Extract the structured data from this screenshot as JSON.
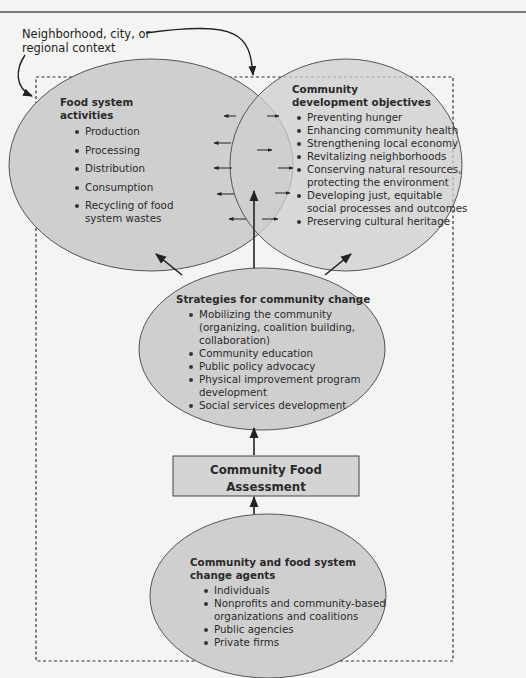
{
  "context_label": {
    "line1": "Neighborhood, city, or",
    "line2": "regional context"
  },
  "food_system": {
    "title": "Food system activities",
    "items": [
      "Production",
      "Processing",
      "Distribution",
      "Consumption",
      "Recycling of food",
      "system wastes"
    ]
  },
  "community_development": {
    "title_line1": "Community",
    "title_line2": "development objectives",
    "items": [
      "Preventing hunger",
      "Enhancing community health",
      "Strengthening local economy",
      "Revitalizing neighborhoods",
      "Conserving natural resources,",
      "protecting the environment",
      "Developing just, equitable",
      "social processes and outcomes",
      "Preserving cultural heritage"
    ]
  },
  "strategies": {
    "title": "Strategies for community change",
    "items": [
      "Mobilizing the community",
      "(organizing, coalition building,",
      "collaboration)",
      "Community education",
      "Public policy advocacy",
      "Physical improvement program",
      "development",
      "Social services development"
    ]
  },
  "assessment": {
    "line1": "Community Food",
    "line2": "Assessment"
  },
  "agents": {
    "title_line1": "Community and food system",
    "title_line2": "change agents",
    "items": [
      "Individuals",
      "Nonprofits and community-based",
      "organizations and coalitions",
      "Public agencies",
      "Private firms"
    ]
  },
  "colors": {
    "ellipse_fill": "#cfcfcf",
    "box_fill": "#d4d4d4",
    "stroke": "#333333",
    "background": "#f4f4f2"
  }
}
